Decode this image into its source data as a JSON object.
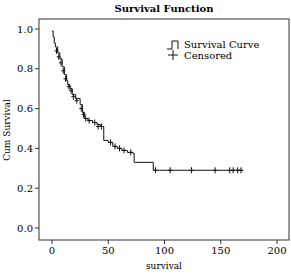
{
  "chart_data": {
    "type": "line",
    "title": "Survival Function",
    "xlabel": "survival",
    "ylabel": "Cum Survival",
    "xlim": [
      -8,
      211
    ],
    "ylim": [
      -0.06,
      1.05
    ],
    "xticks": [
      0,
      50,
      100,
      150,
      200
    ],
    "yticks": [
      0.0,
      0.2,
      0.4,
      0.6,
      0.8,
      1.0
    ],
    "ytick_labels": [
      "0.0",
      "0.2",
      "0.4",
      "0.6",
      "0.8",
      "1.0"
    ],
    "grid": false,
    "legend_position": "upper right",
    "legend": [
      "Survival Curve",
      "Censored"
    ],
    "series": [
      {
        "name": "Survival Curve",
        "step": true,
        "x": [
          0,
          1,
          2,
          3,
          5,
          7,
          9,
          11,
          13,
          14,
          16,
          18,
          21,
          25,
          27,
          29,
          32,
          36,
          40,
          43,
          46,
          50,
          54,
          58,
          62,
          67,
          72,
          73,
          90,
          170
        ],
        "y": [
          0.99,
          0.96,
          0.93,
          0.91,
          0.88,
          0.85,
          0.81,
          0.77,
          0.74,
          0.72,
          0.7,
          0.67,
          0.65,
          0.62,
          0.58,
          0.55,
          0.54,
          0.53,
          0.52,
          0.51,
          0.44,
          0.43,
          0.41,
          0.4,
          0.39,
          0.38,
          0.375,
          0.33,
          0.29,
          0.29
        ]
      },
      {
        "name": "Censored",
        "marker": "+",
        "x": [
          4,
          6,
          8,
          10,
          12,
          15,
          17,
          19,
          22,
          26,
          28,
          30,
          33,
          38,
          41,
          44,
          52,
          56,
          60,
          64,
          70,
          92,
          105,
          124,
          145,
          158,
          161,
          165,
          168
        ],
        "y": [
          0.89,
          0.86,
          0.83,
          0.79,
          0.75,
          0.71,
          0.69,
          0.66,
          0.64,
          0.6,
          0.57,
          0.55,
          0.54,
          0.53,
          0.51,
          0.51,
          0.43,
          0.41,
          0.4,
          0.39,
          0.38,
          0.29,
          0.29,
          0.29,
          0.29,
          0.29,
          0.29,
          0.29,
          0.29
        ]
      }
    ]
  },
  "labels": {
    "title": "Survival Function",
    "xlabel": "survival",
    "ylabel": "Cum Survival",
    "legend_curve": "Survival Curve",
    "legend_censored": "Censored"
  },
  "colors": {
    "line": "#111111",
    "frame": "#333333",
    "background": "#ffffff"
  }
}
